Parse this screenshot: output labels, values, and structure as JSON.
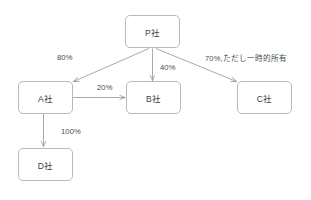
{
  "diagram": {
    "type": "ownership-structure-diagram",
    "background_color": "#ffffff",
    "node_border_color": "#b9b9b9",
    "edge_color": "#9a9a9a",
    "text_color": "#3a3a3a",
    "nodes": [
      {
        "id": "P",
        "label": "P社",
        "x": 125,
        "y": 15,
        "w": 55,
        "h": 33
      },
      {
        "id": "A",
        "label": "A社",
        "x": 18,
        "y": 81,
        "w": 55,
        "h": 33
      },
      {
        "id": "B",
        "label": "B社",
        "x": 126,
        "y": 81,
        "w": 55,
        "h": 33
      },
      {
        "id": "C",
        "label": "C社",
        "x": 237,
        "y": 81,
        "w": 55,
        "h": 33
      },
      {
        "id": "D",
        "label": "D社",
        "x": 18,
        "y": 148,
        "w": 55,
        "h": 33
      }
    ],
    "edges": [
      {
        "id": "p-a",
        "from": "P",
        "to": "A",
        "label": "80%",
        "label_x": 57,
        "label_y": 53
      },
      {
        "id": "p-b",
        "from": "P",
        "to": "B",
        "label": "40%",
        "label_x": 160,
        "label_y": 63
      },
      {
        "id": "p-c",
        "from": "P",
        "to": "C",
        "label": "70%,ただし一時的所有",
        "label_x": 205,
        "label_y": 52
      },
      {
        "id": "a-b",
        "from": "A",
        "to": "B",
        "label": "20%",
        "label_x": 97,
        "label_y": 83
      },
      {
        "id": "a-d",
        "from": "A",
        "to": "D",
        "label": "100%",
        "label_x": 61,
        "label_y": 127
      }
    ]
  }
}
